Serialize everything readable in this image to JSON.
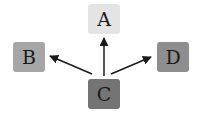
{
  "diagram": {
    "type": "directed-graph",
    "nodes": [
      {
        "id": "A",
        "label": "A",
        "color": "#e4e4e4"
      },
      {
        "id": "B",
        "label": "B",
        "color": "#a6a6a6"
      },
      {
        "id": "C",
        "label": "C",
        "color": "#747474"
      },
      {
        "id": "D",
        "label": "D",
        "color": "#8e8e8e"
      }
    ],
    "edges": [
      {
        "from": "C",
        "to": "A"
      },
      {
        "from": "C",
        "to": "B"
      },
      {
        "from": "C",
        "to": "D"
      }
    ]
  }
}
